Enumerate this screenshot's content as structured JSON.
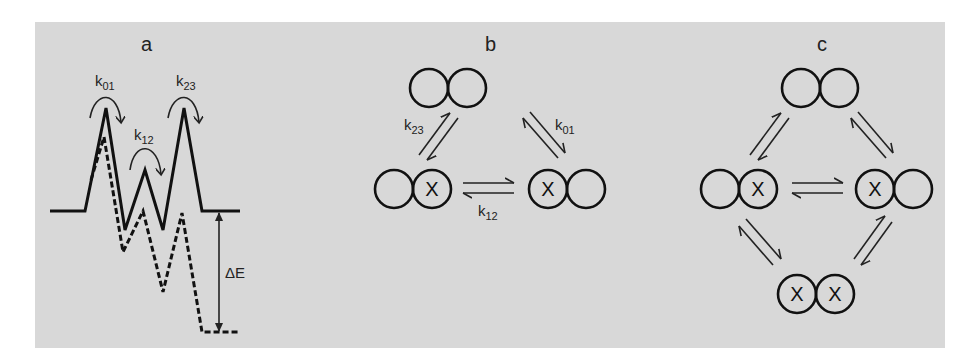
{
  "figure": {
    "background_color": "#d8d8d8",
    "line_color": "#111111"
  },
  "panels": {
    "a": {
      "label": "a",
      "rate_labels": [
        {
          "k": "k",
          "sub": "01"
        },
        {
          "k": "k",
          "sub": "12"
        },
        {
          "k": "k",
          "sub": "23"
        }
      ],
      "energy_label": "ΔE",
      "profiles": [
        {
          "name": "solid",
          "style": "solid"
        },
        {
          "name": "dashed",
          "style": "dashed"
        }
      ]
    },
    "b": {
      "label": "b",
      "states": [
        {
          "name": "top",
          "left": "",
          "right": ""
        },
        {
          "name": "bottom-left",
          "left": "",
          "right": "X"
        },
        {
          "name": "bottom-right",
          "left": "X",
          "right": ""
        }
      ],
      "rate_labels": [
        {
          "k": "k",
          "sub": "23"
        },
        {
          "k": "k",
          "sub": "01"
        },
        {
          "k": "k",
          "sub": "12"
        }
      ]
    },
    "c": {
      "label": "c",
      "states": [
        {
          "name": "top",
          "left": "",
          "right": ""
        },
        {
          "name": "middle-left",
          "left": "",
          "right": "X"
        },
        {
          "name": "middle-right",
          "left": "X",
          "right": ""
        },
        {
          "name": "bottom",
          "left": "X",
          "right": "X"
        }
      ]
    }
  }
}
